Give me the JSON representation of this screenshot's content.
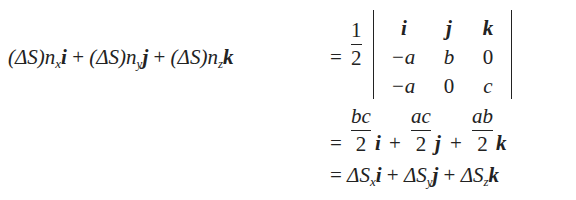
{
  "equation": {
    "line1": {
      "lhs_terms": [
        {
          "coef": "(ΔS)",
          "n": "n",
          "sub": "x",
          "vec": "i"
        },
        {
          "coef": "(ΔS)",
          "n": "n",
          "sub": "y",
          "vec": "j"
        },
        {
          "coef": "(ΔS)",
          "n": "n",
          "sub": "z",
          "vec": "k"
        }
      ],
      "plus": "+",
      "equals": "=",
      "prefactor": {
        "num": "1",
        "den": "2"
      },
      "determinant": {
        "rows": [
          [
            "i",
            "j",
            "k"
          ],
          [
            "−a",
            "b",
            "0"
          ],
          [
            "−a",
            "0",
            "c"
          ]
        ]
      }
    },
    "line2": {
      "equals": "=",
      "terms": [
        {
          "num": "bc",
          "den": "2",
          "vec": "i"
        },
        {
          "num": "ac",
          "den": "2",
          "vec": "j"
        },
        {
          "num": "ab",
          "den": "2",
          "vec": "k"
        }
      ],
      "plus": "+"
    },
    "line3": {
      "equals": "=",
      "terms": [
        {
          "sym": "ΔS",
          "sub": "x",
          "vec": "i"
        },
        {
          "sym": "ΔS",
          "sub": "y",
          "vec": "j"
        },
        {
          "sym": "ΔS",
          "sub": "z",
          "vec": "k"
        }
      ],
      "plus": "+"
    }
  }
}
